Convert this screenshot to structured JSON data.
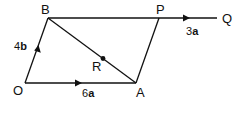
{
  "diagram": {
    "type": "vector-geometry",
    "colors": {
      "stroke": "#111111",
      "background": "#ffffff"
    },
    "points": {
      "O": {
        "label": "O",
        "x": 25,
        "y": 83
      },
      "A": {
        "label": "A",
        "x": 136,
        "y": 83
      },
      "B": {
        "label": "B",
        "x": 48,
        "y": 18
      },
      "P": {
        "label": "P",
        "x": 159,
        "y": 18
      },
      "Q": {
        "label": "Q",
        "x": 217,
        "y": 18
      },
      "R": {
        "label": "R",
        "x": 103,
        "y": 58
      }
    },
    "segments": [
      {
        "from": "O",
        "to": "A",
        "arrow": true,
        "vector_label": {
          "coef": "6",
          "sym": "a"
        }
      },
      {
        "from": "O",
        "to": "B",
        "arrow": true,
        "vector_label": {
          "coef": "4",
          "sym": "b"
        }
      },
      {
        "from": "B",
        "to": "Q",
        "arrow": true,
        "vector_label": {
          "coef": "3",
          "sym": "a"
        }
      },
      {
        "from": "B",
        "to": "A",
        "arrow": false
      },
      {
        "from": "A",
        "to": "P",
        "arrow": false
      }
    ],
    "labels": {
      "O": "O",
      "A": "A",
      "B": "B",
      "P": "P",
      "Q": "Q",
      "R": "R",
      "OA": {
        "coef": "6",
        "sym": "a"
      },
      "OB": {
        "coef": "4",
        "sym": "b"
      },
      "PQ": {
        "coef": "3",
        "sym": "a"
      }
    }
  }
}
